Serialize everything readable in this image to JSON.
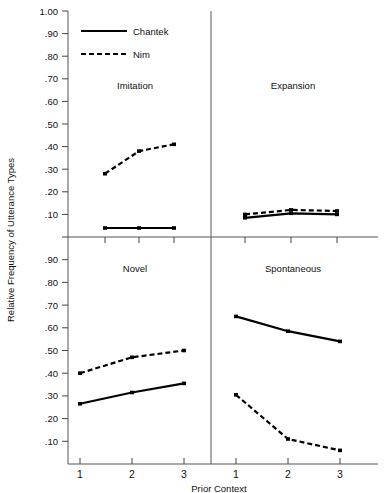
{
  "chart_data": {
    "type": "line",
    "title": "",
    "xlabel": "Prior Context",
    "ylabel": "Relative Frequency of Utterance Types",
    "x": [
      1,
      2,
      3
    ],
    "xtick_labels": [
      "1",
      "2",
      "3"
    ],
    "ylim": [
      0,
      1.0
    ],
    "ytick_labels": [
      ".10",
      ".20",
      ".30",
      ".40",
      ".50",
      ".60",
      ".70",
      ".80",
      ".90",
      "1.00"
    ],
    "ytick_values": [
      0.1,
      0.2,
      0.3,
      0.4,
      0.5,
      0.6,
      0.7,
      0.8,
      0.9,
      1.0
    ],
    "grid": false,
    "legend_position": "top-left",
    "legend": [
      {
        "name": "Chantek",
        "style": "solid"
      },
      {
        "name": "Nim",
        "style": "dashed"
      }
    ],
    "panels": [
      {
        "label": "Imitation",
        "position": "top-left",
        "series": [
          {
            "name": "Chantek",
            "style": "solid",
            "values": [
              0.04,
              0.04,
              0.04
            ]
          },
          {
            "name": "Nim",
            "style": "dashed",
            "values": [
              0.28,
              0.38,
              0.41
            ]
          }
        ]
      },
      {
        "label": "Expansion",
        "position": "top-right",
        "series": [
          {
            "name": "Chantek",
            "style": "solid",
            "values": [
              0.085,
              0.105,
              0.1
            ]
          },
          {
            "name": "Nim",
            "style": "dashed",
            "values": [
              0.1,
              0.12,
              0.115
            ]
          }
        ]
      },
      {
        "label": "Novel",
        "position": "bottom-left",
        "series": [
          {
            "name": "Chantek",
            "style": "solid",
            "values": [
              0.265,
              0.315,
              0.355
            ]
          },
          {
            "name": "Nim",
            "style": "dashed",
            "values": [
              0.4,
              0.47,
              0.5
            ]
          }
        ]
      },
      {
        "label": "Spontaneous",
        "position": "bottom-right",
        "series": [
          {
            "name": "Chantek",
            "style": "solid",
            "values": [
              0.65,
              0.585,
              0.54
            ]
          },
          {
            "name": "Nim",
            "style": "dashed",
            "values": [
              0.305,
              0.11,
              0.06
            ]
          }
        ]
      }
    ],
    "colors": {
      "series": "#000000",
      "axis": "#555555",
      "background": "#ffffff"
    }
  },
  "axes": {
    "x_title": "Prior Context",
    "y_title": "Relative Frequency of Utterance Types"
  }
}
